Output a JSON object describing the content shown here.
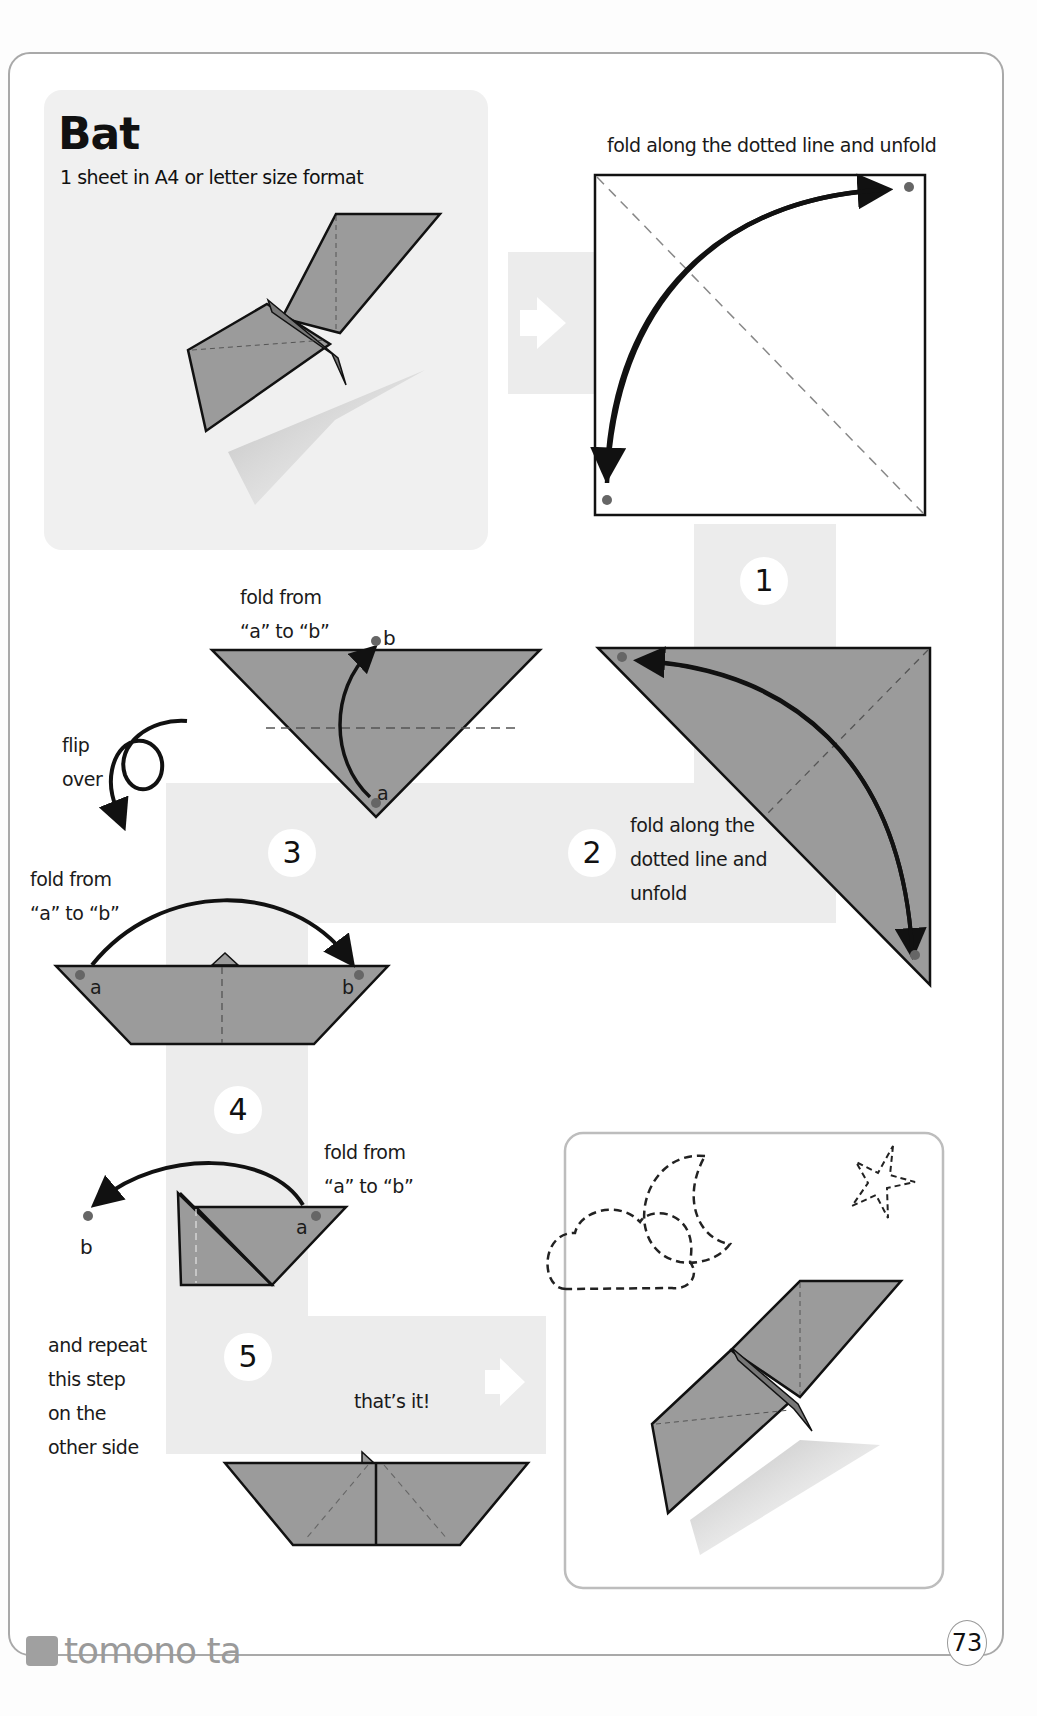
{
  "title": "Bat",
  "materials": "1 sheet in A4 or letter size format",
  "colors": {
    "paper": "#9b9b9b",
    "outline": "#111111",
    "band": "#ececec",
    "dot": "#666666",
    "page_border": "#a9a9a9"
  },
  "steps": [
    {
      "number": "1",
      "instruction": "fold along the dotted line and unfold"
    },
    {
      "number": "2",
      "instruction": "fold along the\ndotted line and\nunfold"
    },
    {
      "number": "3",
      "instruction": "fold from\n“a” to “b”",
      "side_note": "flip\nover",
      "point_a": "a",
      "point_b": "b"
    },
    {
      "number": "4",
      "instruction": "fold from\n“a” to “b”",
      "point_a": "a",
      "point_b": "b"
    },
    {
      "number": "5",
      "instruction": "fold from\n“a” to “b”",
      "repeat_note": "and repeat\nthis step\non the\nother side",
      "point_a": "a",
      "point_b": "b",
      "done_note": "that’s it!"
    }
  ],
  "footer": {
    "brand": "tomono ta",
    "page_number": "73"
  }
}
